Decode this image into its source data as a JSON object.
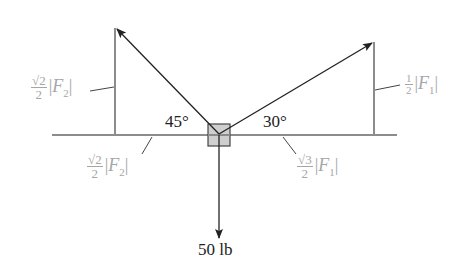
{
  "diagram": {
    "type": "force-vector-diagram",
    "colors": {
      "vector": "#222222",
      "component_line": "#8c8c8c",
      "label_gray": "#a6a6a6",
      "box_fill": "#cfcfcf",
      "box_stroke": "#444444"
    },
    "angles": {
      "left": "45°",
      "right": "30°"
    },
    "weight": {
      "label": "50 lb"
    },
    "components": {
      "left_vertical": {
        "numerator": "√2",
        "denominator": "2",
        "symbol": "F",
        "subscript": "2"
      },
      "left_horizontal": {
        "numerator": "√2",
        "denominator": "2",
        "symbol": "F",
        "subscript": "2"
      },
      "right_vertical": {
        "numerator": "1",
        "denominator": "2",
        "symbol": "F",
        "subscript": "1"
      },
      "right_horizontal": {
        "numerator": "√3",
        "denominator": "2",
        "symbol": "F",
        "subscript": "1"
      }
    }
  }
}
